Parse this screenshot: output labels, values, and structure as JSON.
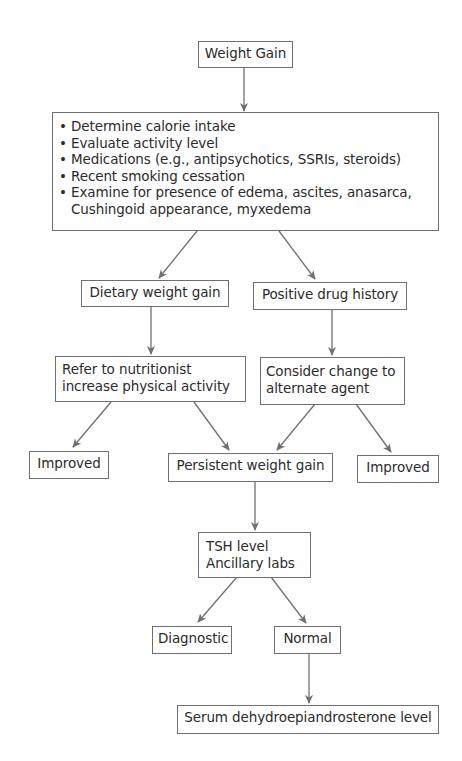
{
  "diagram": {
    "type": "flowchart",
    "line_color": "#707070",
    "border_color": "#6f6f6f",
    "text_color": "#2b2b2b",
    "background": "#ffffff",
    "nodes": {
      "weight_gain": {
        "label": "Weight Gain"
      },
      "initial_eval": {
        "bullet_glyph": "•",
        "items": [
          {
            "text": "Determine calorie intake"
          },
          {
            "text": "Evaluate activity level"
          },
          {
            "text": "Medications (e.g., antipsychotics, SSRIs, steroids)"
          },
          {
            "text": "Recent smoking cessation"
          },
          {
            "text": "Examine for presence of edema, ascites, anasarca,",
            "continuation": "Cushingoid appearance, myxedema"
          }
        ]
      },
      "dietary": {
        "label": "Dietary weight gain"
      },
      "drug_history": {
        "label": "Positive drug history"
      },
      "nutritionist": {
        "lines": [
          "Refer to nutritionist",
          "increase physical activity"
        ]
      },
      "alternate_agent": {
        "lines": [
          "Consider change to",
          "alternate agent"
        ]
      },
      "improved_left": {
        "label": "Improved"
      },
      "persistent": {
        "label": "Persistent weight gain"
      },
      "improved_right": {
        "label": "Improved"
      },
      "tsh": {
        "lines": [
          "TSH level",
          "Ancillary labs"
        ]
      },
      "diagnostic": {
        "label": "Diagnostic"
      },
      "normal": {
        "label": "Normal"
      },
      "serum": {
        "label": "Serum dehydroepiandrosterone level"
      }
    },
    "edges": [
      {
        "from": "Weight Gain",
        "to": "Initial evaluation"
      },
      {
        "from": "Initial evaluation",
        "to": "Dietary weight gain"
      },
      {
        "from": "Initial evaluation",
        "to": "Positive drug history"
      },
      {
        "from": "Dietary weight gain",
        "to": "Refer to nutritionist / increase physical activity"
      },
      {
        "from": "Positive drug history",
        "to": "Consider change to alternate agent"
      },
      {
        "from": "Refer to nutritionist / increase physical activity",
        "to": "Improved (left)"
      },
      {
        "from": "Refer to nutritionist / increase physical activity",
        "to": "Persistent weight gain"
      },
      {
        "from": "Consider change to alternate agent",
        "to": "Persistent weight gain"
      },
      {
        "from": "Consider change to alternate agent",
        "to": "Improved (right)"
      },
      {
        "from": "Persistent weight gain",
        "to": "TSH level / Ancillary labs"
      },
      {
        "from": "TSH level / Ancillary labs",
        "to": "Diagnostic"
      },
      {
        "from": "TSH level / Ancillary labs",
        "to": "Normal"
      },
      {
        "from": "Normal",
        "to": "Serum dehydroepiandrosterone level"
      }
    ]
  }
}
